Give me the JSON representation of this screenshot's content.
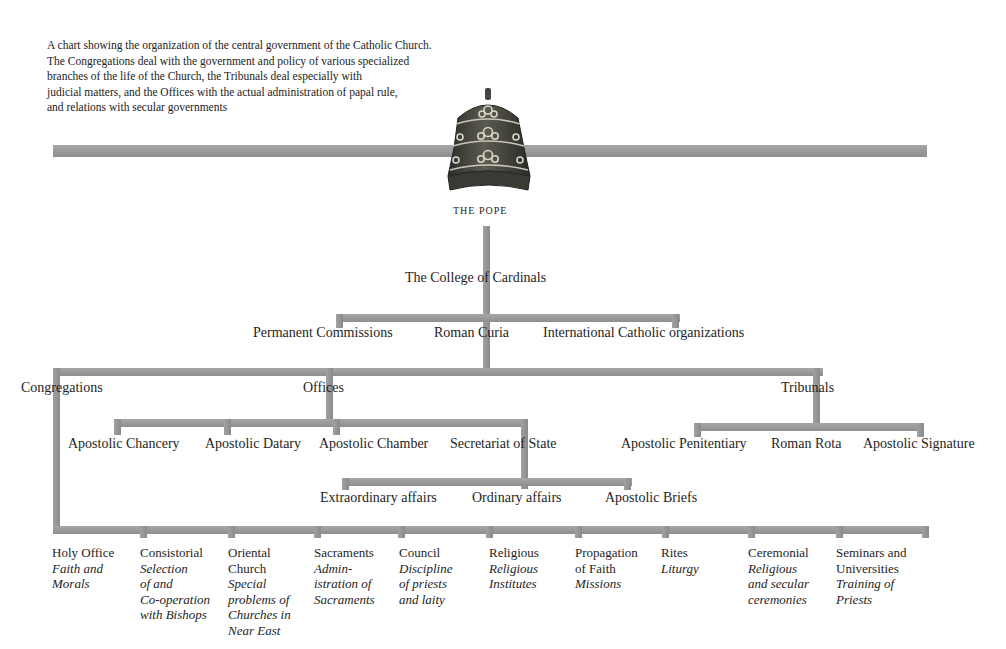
{
  "caption": {
    "lines": [
      "A chart showing the organization of the central government of the Catholic Church.",
      "The Congregations deal with the government and policy of various specialized",
      "branches of the life of the Church, the Tribunals deal especially with",
      "judicial matters, and the Offices with the actual administration of papal rule,",
      "and relations with secular governments"
    ]
  },
  "colors": {
    "connector": "#9a9a9a",
    "text": "#1e1e1e",
    "tiara_dark": "#3a3a34",
    "tiara_mid": "#6b6a5e",
    "tiara_light": "#c8c6b8"
  },
  "root": {
    "icon": "papal-tiara-icon",
    "label": "THE POPE"
  },
  "level1": {
    "college": "The College of Cardinals",
    "branches": [
      "Permanent Commissions",
      "Roman Curia",
      "International Catholic organizations"
    ]
  },
  "curia": {
    "divisions": [
      "Congregations",
      "Offices",
      "Tribunals"
    ]
  },
  "offices": {
    "items": [
      "Apostolic Chancery",
      "Apostolic Datary",
      "Apostolic Chamber",
      "Secretariat of State"
    ],
    "secretariat_children": [
      "Extraordinary affairs",
      "Ordinary affairs",
      "Apostolic Briefs"
    ]
  },
  "tribunals": {
    "items": [
      "Apostolic Penitentiary",
      "Roman Rota",
      "Apostolic Signature"
    ]
  },
  "congregations": {
    "items": [
      {
        "name": [
          "Holy Office"
        ],
        "desc": [
          "Faith and",
          "Morals"
        ]
      },
      {
        "name": [
          "Consistorial"
        ],
        "desc": [
          "Selection",
          "of and",
          "Co-operation",
          "with Bishops"
        ]
      },
      {
        "name": [
          "Oriental",
          "Church"
        ],
        "desc": [
          "Special",
          "problems of",
          "Churches in",
          "Near East"
        ]
      },
      {
        "name": [
          "Sacraments"
        ],
        "desc": [
          "Admin-",
          "istration of",
          "Sacraments"
        ]
      },
      {
        "name": [
          "Council"
        ],
        "desc": [
          "Discipline",
          "of priests",
          "and laity"
        ]
      },
      {
        "name": [
          "Religious"
        ],
        "desc": [
          "Religious",
          "Institutes"
        ]
      },
      {
        "name": [
          "Propagation",
          "of Faith"
        ],
        "desc": [
          "Missions"
        ]
      },
      {
        "name": [
          "Rites"
        ],
        "desc": [
          "Liturgy"
        ]
      },
      {
        "name": [
          "Ceremonial"
        ],
        "desc": [
          "Religious",
          "and secular",
          "ceremonies"
        ]
      },
      {
        "name": [
          "Seminars and",
          "Universities"
        ],
        "desc": [
          "Training of",
          "Priests"
        ]
      }
    ]
  }
}
